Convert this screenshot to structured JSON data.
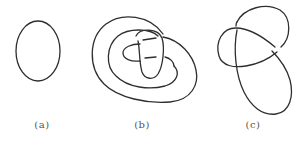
{
  "figure": {
    "panels": [
      {
        "id": "a",
        "label": "(a)",
        "description": "unknot (simple closed loop)"
      },
      {
        "id": "b",
        "label": "(b)",
        "description": "knot diagram with nested loops and crossings"
      },
      {
        "id": "c",
        "label": "(c)",
        "description": "knot diagram with overlapping loops"
      }
    ],
    "stroke_color": "#2e2e2e",
    "label_color": "#555555"
  }
}
